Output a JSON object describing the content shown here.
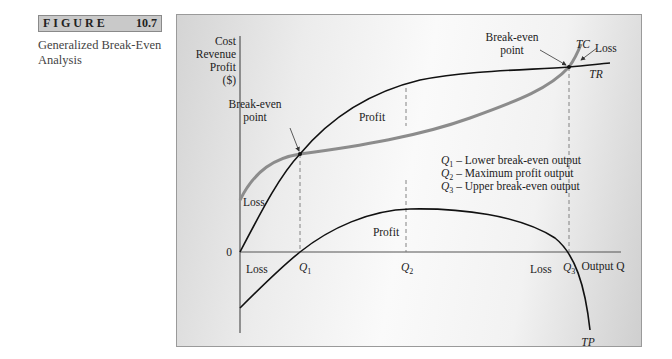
{
  "figure": {
    "label_word": "FIGURE",
    "label_number": "10.7",
    "caption_line1": "Generalized Break-Even",
    "caption_line2": "Analysis"
  },
  "diagram": {
    "y_axis_label": [
      "Cost",
      "Revenue",
      "Profit",
      "($)"
    ],
    "x_axis_label": "Output Q",
    "origin_label": "0",
    "curves": {
      "total_revenue": "TR",
      "total_cost": "TC",
      "total_profit": "TP"
    },
    "annotations": {
      "break_even_lower": [
        "Break-even",
        "point"
      ],
      "break_even_upper": [
        "Break-even",
        "point"
      ],
      "profit_upper": "Profit",
      "profit_lower": "Profit",
      "loss_upper_left": "Loss",
      "loss_upper_right": "Loss",
      "loss_lower_left": "Loss",
      "loss_lower_right": "Loss"
    },
    "q_ticks": [
      {
        "sym": "Q",
        "sub": "1"
      },
      {
        "sym": "Q",
        "sub": "2"
      },
      {
        "sym": "Q",
        "sub": "3"
      }
    ],
    "legend": [
      {
        "sym": "Q",
        "sub": "1",
        "text": " – Lower break-even output"
      },
      {
        "sym": "Q",
        "sub": "2",
        "text": " – Maximum profit output"
      },
      {
        "sym": "Q",
        "sub": "3",
        "text": " – Upper break-even output"
      }
    ],
    "colors": {
      "tr_line": "#111111",
      "tc_line": "#8c8c8c",
      "tp_line": "#111111",
      "axis": "#555555",
      "dashed": "#777777"
    }
  }
}
